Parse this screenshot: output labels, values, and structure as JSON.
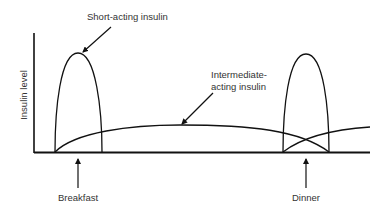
{
  "diagram": {
    "y_axis_label": "Insulin level",
    "labels": {
      "short_acting": "Short-acting insulin",
      "intermediate_line1": "Intermediate-",
      "intermediate_line2": "acting insulin",
      "breakfast": "Breakfast",
      "dinner": "Dinner"
    },
    "colors": {
      "line": "#111111",
      "text": "#333333",
      "background": "#ffffff"
    }
  }
}
